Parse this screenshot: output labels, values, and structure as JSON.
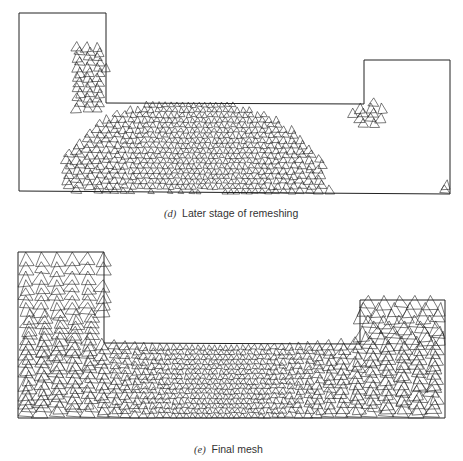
{
  "figures": [
    {
      "id": "d",
      "label": "(d)",
      "title": "Later stage of remeshing",
      "boundary": [
        [
          19,
          13
        ],
        [
          106,
          13
        ],
        [
          106,
          103
        ],
        [
          364,
          104
        ],
        [
          364,
          60
        ],
        [
          450,
          60
        ],
        [
          450,
          194
        ],
        [
          19,
          191
        ]
      ]
    },
    {
      "id": "e",
      "label": "(e)",
      "title": "Final mesh",
      "boundary": [
        [
          18,
          252
        ],
        [
          104,
          252
        ],
        [
          104,
          343
        ],
        [
          360,
          344
        ],
        [
          360,
          300
        ],
        [
          445,
          300
        ],
        [
          445,
          418
        ],
        [
          18,
          418
        ]
      ]
    }
  ],
  "colors": {
    "line": "#222222",
    "background": "#ffffff"
  }
}
